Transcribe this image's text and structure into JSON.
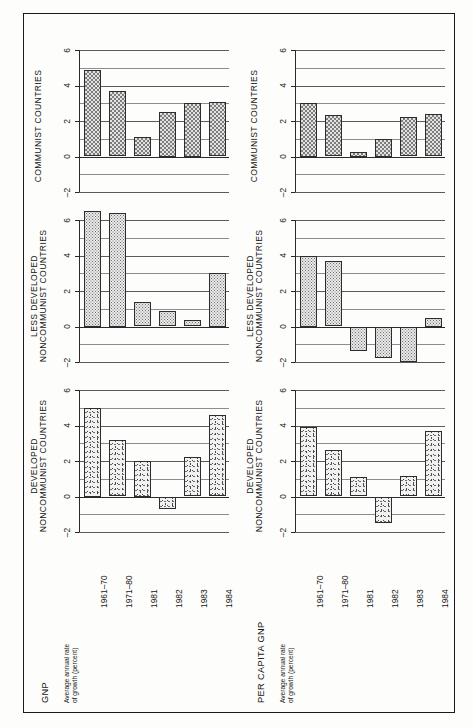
{
  "figure": {
    "categories": [
      "1961–70",
      "1971–80",
      "1981",
      "1982",
      "1983",
      "1984"
    ],
    "y_ticks": [
      "6",
      "4",
      "2",
      "0",
      "–2"
    ],
    "axis_note": "Average annual rate\nof growth (percent)"
  },
  "columns": [
    {
      "key": "gnp",
      "footer_title": "GNP",
      "footer_sub": "Average annual rate\nof growth (percent)",
      "panels": [
        {
          "title": "COMMUNIST COUNTRIES",
          "fill": "fill-check"
        },
        {
          "title": "LESS DEVELOPED\nNONCOMMUNIST COUNTRIES",
          "fill": "fill-dot"
        },
        {
          "title": "DEVELOPED\nNONCOMMUNIST COUNTRIES",
          "fill": "fill-speck"
        }
      ]
    },
    {
      "key": "per_capita_gnp",
      "footer_title": "PER CAPITA GNP",
      "footer_sub": "Average annual rate\nof growth (percent)",
      "panels": [
        {
          "title": "COMMUNIST COUNTRIES",
          "fill": "fill-check"
        },
        {
          "title": "LESS DEVELOPED\nNONCOMMUNIST COUNTRIES",
          "fill": "fill-dot"
        },
        {
          "title": "DEVELOPED\nNONCOMMUNIST COUNTRIES",
          "fill": "fill-speck"
        }
      ]
    }
  ],
  "chart_data": [
    {
      "type": "bar",
      "title": "GNP — Communist Countries",
      "xlabel": "",
      "ylabel": "Average annual rate of growth (percent)",
      "categories": [
        "1961–70",
        "1971–80",
        "1981",
        "1982",
        "1983",
        "1984"
      ],
      "values": [
        4.9,
        3.7,
        1.1,
        2.5,
        3.0,
        3.05
      ],
      "ylim": [
        -2,
        6
      ],
      "ytick_values": [
        -2,
        0,
        2,
        4,
        6
      ],
      "grid": true,
      "legend": "none"
    },
    {
      "type": "bar",
      "title": "GNP — Less Developed Noncommunist Countries",
      "xlabel": "",
      "ylabel": "Average annual rate of growth (percent)",
      "categories": [
        "1961–70",
        "1971–80",
        "1981",
        "1982",
        "1983",
        "1984"
      ],
      "values": [
        6.5,
        6.4,
        1.4,
        0.9,
        0.35,
        3.0
      ],
      "ylim": [
        -2,
        6
      ],
      "ytick_values": [
        -2,
        0,
        2,
        4,
        6
      ],
      "grid": true,
      "legend": "none"
    },
    {
      "type": "bar",
      "title": "GNP — Developed Noncommunist Countries",
      "xlabel": "",
      "ylabel": "Average annual rate of growth (percent)",
      "categories": [
        "1961–70",
        "1971–80",
        "1981",
        "1982",
        "1983",
        "1984"
      ],
      "values": [
        5.0,
        3.2,
        2.0,
        -0.7,
        2.2,
        4.6
      ],
      "ylim": [
        -2,
        6
      ],
      "ytick_values": [
        -2,
        0,
        2,
        4,
        6
      ],
      "grid": true,
      "legend": "none"
    },
    {
      "type": "bar",
      "title": "Per Capita GNP — Communist Countries",
      "xlabel": "",
      "ylabel": "Average annual rate of growth (percent)",
      "categories": [
        "1961–70",
        "1971–80",
        "1981",
        "1982",
        "1983",
        "1984"
      ],
      "values": [
        3.0,
        2.35,
        0.25,
        1.0,
        2.2,
        2.4
      ],
      "ylim": [
        -2,
        6
      ],
      "ytick_values": [
        -2,
        0,
        2,
        4,
        6
      ],
      "grid": true,
      "legend": "none"
    },
    {
      "type": "bar",
      "title": "Per Capita GNP — Less Developed Noncommunist Countries",
      "xlabel": "",
      "ylabel": "Average annual rate of growth (percent)",
      "categories": [
        "1961–70",
        "1971–80",
        "1981",
        "1982",
        "1983",
        "1984"
      ],
      "values": [
        4.0,
        3.7,
        -1.4,
        -1.75,
        -2.0,
        0.5
      ],
      "ylim": [
        -2,
        6
      ],
      "ytick_values": [
        -2,
        0,
        2,
        4,
        6
      ],
      "grid": true,
      "legend": "none"
    },
    {
      "type": "bar",
      "title": "Per Capita GNP — Developed Noncommunist Countries",
      "xlabel": "",
      "ylabel": "Average annual rate of growth (percent)",
      "categories": [
        "1961–70",
        "1971–80",
        "1981",
        "1982",
        "1983",
        "1984"
      ],
      "values": [
        3.9,
        2.6,
        1.1,
        -1.5,
        1.15,
        3.7
      ],
      "ylim": [
        -2,
        6
      ],
      "ytick_values": [
        -2,
        0,
        2,
        4,
        6
      ],
      "grid": true,
      "legend": "none"
    }
  ]
}
